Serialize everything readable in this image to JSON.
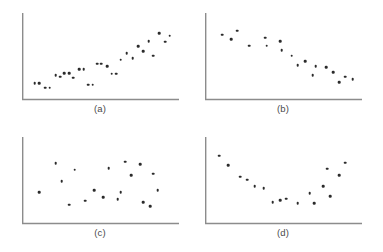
{
  "figure": {
    "background_color": "#ffffff",
    "axis_color": "#8c8c8c",
    "dot_color": "#2b2b2b",
    "caption_color": "#4a4a4a"
  },
  "chart_data": [
    {
      "type": "scatter",
      "panel": "a",
      "caption": "(a)",
      "title": "",
      "xlabel": "",
      "ylabel": "",
      "xlim": [
        0,
        100
      ],
      "ylim": [
        0,
        100
      ],
      "grid": false,
      "legend": "none",
      "relationship": "strong positive linear",
      "points": [
        {
          "x": 6,
          "y": 14
        },
        {
          "x": 9,
          "y": 14
        },
        {
          "x": 13,
          "y": 8
        },
        {
          "x": 16,
          "y": 8
        },
        {
          "x": 20,
          "y": 24
        },
        {
          "x": 23,
          "y": 22
        },
        {
          "x": 26,
          "y": 27
        },
        {
          "x": 29,
          "y": 27
        },
        {
          "x": 32,
          "y": 21
        },
        {
          "x": 36,
          "y": 32
        },
        {
          "x": 39,
          "y": 32
        },
        {
          "x": 42,
          "y": 12
        },
        {
          "x": 45,
          "y": 12
        },
        {
          "x": 48,
          "y": 39
        },
        {
          "x": 51,
          "y": 39
        },
        {
          "x": 55,
          "y": 36
        },
        {
          "x": 58,
          "y": 26
        },
        {
          "x": 61,
          "y": 26
        },
        {
          "x": 64,
          "y": 44
        },
        {
          "x": 68,
          "y": 52
        },
        {
          "x": 72,
          "y": 46
        },
        {
          "x": 76,
          "y": 61
        },
        {
          "x": 79,
          "y": 55
        },
        {
          "x": 83,
          "y": 68
        },
        {
          "x": 86,
          "y": 49
        },
        {
          "x": 90,
          "y": 78
        },
        {
          "x": 94,
          "y": 67
        },
        {
          "x": 97,
          "y": 75
        }
      ]
    },
    {
      "type": "scatter",
      "panel": "b",
      "caption": "(b)",
      "title": "",
      "xlabel": "",
      "ylabel": "",
      "xlim": [
        0,
        100
      ],
      "ylim": [
        0,
        100
      ],
      "grid": false,
      "legend": "none",
      "relationship": "strong negative linear",
      "points": [
        {
          "x": 9,
          "y": 76
        },
        {
          "x": 15,
          "y": 70
        },
        {
          "x": 19,
          "y": 81
        },
        {
          "x": 27,
          "y": 62
        },
        {
          "x": 38,
          "y": 72
        },
        {
          "x": 39,
          "y": 62
        },
        {
          "x": 48,
          "y": 68
        },
        {
          "x": 49,
          "y": 56
        },
        {
          "x": 56,
          "y": 49
        },
        {
          "x": 60,
          "y": 37
        },
        {
          "x": 65,
          "y": 42
        },
        {
          "x": 70,
          "y": 24
        },
        {
          "x": 72,
          "y": 36
        },
        {
          "x": 79,
          "y": 34
        },
        {
          "x": 84,
          "y": 28
        },
        {
          "x": 88,
          "y": 15
        },
        {
          "x": 92,
          "y": 22
        },
        {
          "x": 97,
          "y": 19
        }
      ]
    },
    {
      "type": "scatter",
      "panel": "c",
      "caption": "(c)",
      "title": "",
      "xlabel": "",
      "ylabel": "",
      "xlim": [
        0,
        100
      ],
      "ylim": [
        0,
        100
      ],
      "grid": false,
      "legend": "none",
      "relationship": "no correlation (random scatter)",
      "points": [
        {
          "x": 20,
          "y": 70
        },
        {
          "x": 33,
          "y": 62
        },
        {
          "x": 24,
          "y": 47
        },
        {
          "x": 9,
          "y": 33
        },
        {
          "x": 29,
          "y": 17
        },
        {
          "x": 40,
          "y": 22
        },
        {
          "x": 46,
          "y": 36
        },
        {
          "x": 52,
          "y": 27
        },
        {
          "x": 56,
          "y": 64
        },
        {
          "x": 62,
          "y": 24
        },
        {
          "x": 64,
          "y": 33
        },
        {
          "x": 67,
          "y": 72
        },
        {
          "x": 71,
          "y": 55
        },
        {
          "x": 77,
          "y": 69
        },
        {
          "x": 79,
          "y": 20
        },
        {
          "x": 86,
          "y": 57
        },
        {
          "x": 89,
          "y": 36
        },
        {
          "x": 84,
          "y": 15
        }
      ]
    },
    {
      "type": "scatter",
      "panel": "d",
      "caption": "(d)",
      "title": "",
      "xlabel": "",
      "ylabel": "",
      "xlim": [
        0,
        100
      ],
      "ylim": [
        0,
        100
      ],
      "grid": false,
      "legend": "none",
      "relationship": "curvilinear U-shaped (quadratic)",
      "points": [
        {
          "x": 7,
          "y": 80
        },
        {
          "x": 13,
          "y": 68
        },
        {
          "x": 21,
          "y": 53
        },
        {
          "x": 26,
          "y": 49
        },
        {
          "x": 31,
          "y": 41
        },
        {
          "x": 37,
          "y": 38
        },
        {
          "x": 43,
          "y": 20
        },
        {
          "x": 48,
          "y": 23
        },
        {
          "x": 52,
          "y": 25
        },
        {
          "x": 60,
          "y": 19
        },
        {
          "x": 68,
          "y": 32
        },
        {
          "x": 71,
          "y": 19
        },
        {
          "x": 77,
          "y": 41
        },
        {
          "x": 80,
          "y": 63
        },
        {
          "x": 82,
          "y": 28
        },
        {
          "x": 88,
          "y": 55
        },
        {
          "x": 92,
          "y": 71
        }
      ]
    }
  ]
}
